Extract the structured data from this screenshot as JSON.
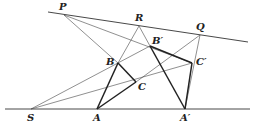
{
  "diagram": {
    "points": {
      "P": {
        "label": "P",
        "x": 64,
        "y": 15
      },
      "R": {
        "label": "R",
        "x": 139,
        "y": 26
      },
      "Q": {
        "label": "Q",
        "x": 200,
        "y": 35
      },
      "B": {
        "label": "B",
        "x": 118,
        "y": 63
      },
      "C": {
        "label": "C",
        "x": 136,
        "y": 82
      },
      "Bp": {
        "label": "B′",
        "x": 150,
        "y": 46
      },
      "Cp": {
        "label": "C′",
        "x": 192,
        "y": 63
      },
      "S": {
        "label": "S",
        "x": 31,
        "y": 109
      },
      "A": {
        "label": "A",
        "x": 97,
        "y": 109
      },
      "Ap": {
        "label": "A′",
        "x": 185,
        "y": 109
      }
    },
    "labels": [
      "P",
      "R",
      "Q",
      "B",
      "B′",
      "C",
      "C′",
      "S",
      "A",
      "A′"
    ],
    "colors": {
      "line": "#333333",
      "thick": "#222222",
      "background": "#ffffff"
    }
  }
}
